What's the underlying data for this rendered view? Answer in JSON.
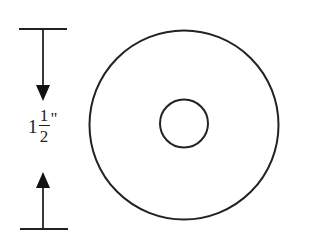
{
  "diagram": {
    "type": "washer-dimension-drawing",
    "dimension": {
      "whole": "1",
      "numerator": "1",
      "denominator": "2",
      "unit": "\"",
      "text": "1 1/2\"",
      "direction": "vertical",
      "arrows": [
        "down-arrow",
        "up-arrow"
      ]
    },
    "shapes": {
      "outer_circle": {
        "cx": 184,
        "cy": 125,
        "r": 95
      },
      "inner_circle": {
        "cx": 184,
        "cy": 123,
        "r": 24
      }
    },
    "colors": {
      "stroke": "#222222",
      "background": "#ffffff"
    }
  }
}
